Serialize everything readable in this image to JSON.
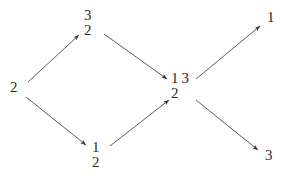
{
  "diagram": {
    "background_color": "#ffffff",
    "ink_color": "#2b2b2b",
    "width": 287,
    "height": 179,
    "nodes": [
      {
        "id": "node-left-2",
        "name": "node-source-2",
        "x": 10,
        "y": 80,
        "rows": [
          [
            "2"
          ]
        ]
      },
      {
        "id": "node-top-32",
        "name": "node-upper-32",
        "x": 84,
        "y": 8,
        "rows": [
          [
            "3"
          ],
          [
            "2"
          ]
        ]
      },
      {
        "id": "node-bottom-12",
        "name": "node-lower-12",
        "x": 92,
        "y": 140,
        "rows": [
          [
            "1"
          ],
          [
            "2"
          ]
        ]
      },
      {
        "id": "node-center-13-2",
        "name": "node-center-132",
        "x": 171,
        "y": 71,
        "rows": [
          [
            "1",
            "3"
          ],
          [
            "2"
          ]
        ]
      },
      {
        "id": "node-right-1",
        "name": "node-sink-1",
        "x": 267,
        "y": 10,
        "rows": [
          [
            "1"
          ]
        ]
      },
      {
        "id": "node-right-3",
        "name": "node-sink-3",
        "x": 265,
        "y": 148,
        "rows": [
          [
            "3"
          ]
        ]
      }
    ],
    "edges": [
      {
        "id": "edge-1",
        "name": "edge-source-to-upper",
        "from": "node-left-2",
        "to": "node-top-32",
        "x1": 28,
        "y1": 82,
        "x2": 79,
        "y2": 35
      },
      {
        "id": "edge-2",
        "name": "edge-source-to-lower",
        "from": "node-left-2",
        "to": "node-bottom-12",
        "x1": 26,
        "y1": 97,
        "x2": 86,
        "y2": 145
      },
      {
        "id": "edge-3",
        "name": "edge-upper-to-center",
        "from": "node-top-32",
        "to": "node-center-13-2",
        "x1": 104,
        "y1": 34,
        "x2": 167,
        "y2": 79
      },
      {
        "id": "edge-4",
        "name": "edge-lower-to-center",
        "from": "node-bottom-12",
        "to": "node-center-13-2",
        "x1": 110,
        "y1": 146,
        "x2": 169,
        "y2": 100
      },
      {
        "id": "edge-5",
        "name": "edge-center-to-sink-1",
        "from": "node-center-13-2",
        "to": "node-right-1",
        "x1": 196,
        "y1": 79,
        "x2": 260,
        "y2": 26
      },
      {
        "id": "edge-6",
        "name": "edge-center-to-sink-3",
        "from": "node-center-13-2",
        "to": "node-right-3",
        "x1": 196,
        "y1": 100,
        "x2": 258,
        "y2": 150
      }
    ]
  }
}
